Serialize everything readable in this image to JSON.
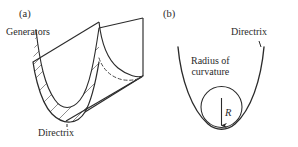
{
  "figure": {
    "background_color": "#ffffff",
    "stroke_color": "#2b2b2b",
    "hatch_color": "#555555"
  },
  "panel_a": {
    "tag": "(a)",
    "labels": {
      "generators": "Generators",
      "directrix": "Directrix"
    },
    "description": "Parabolic cylinder (trough) drawn in oblique projection with a hatched parabolic cross-section at the near end and a dashed hidden parabolic edge at the far end."
  },
  "panel_b": {
    "tag": "(b)",
    "labels": {
      "directrix": "Directrix",
      "radius_of_curvature_line1": "Radius of",
      "radius_of_curvature_line2": "curvature",
      "radius_symbol": "R"
    },
    "description": "Cross-sectional parabola (the directrix curve) with the osculating circle of radius R tangent at the vertex; an arrow from the circle centre points down to the tangent point."
  }
}
